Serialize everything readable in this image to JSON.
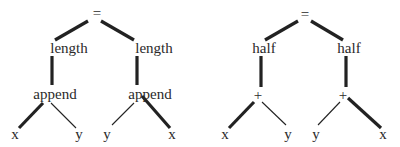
{
  "diagram": {
    "trees": [
      {
        "id": "left-tree",
        "nodes": [
          {
            "id": "eq",
            "label": "=",
            "x": 97,
            "y": 13
          },
          {
            "id": "len1",
            "label": "length",
            "x": 69,
            "y": 48
          },
          {
            "id": "len2",
            "label": "length",
            "x": 154,
            "y": 48
          },
          {
            "id": "app1",
            "label": "append",
            "x": 55,
            "y": 94
          },
          {
            "id": "app2",
            "label": "append",
            "x": 150,
            "y": 94
          },
          {
            "id": "x1",
            "label": "x",
            "x": 15,
            "y": 134
          },
          {
            "id": "y1",
            "label": "y",
            "x": 79,
            "y": 134
          },
          {
            "id": "y2",
            "label": "y",
            "x": 107,
            "y": 134
          },
          {
            "id": "x2",
            "label": "x",
            "x": 172,
            "y": 134
          }
        ],
        "edges": [
          {
            "from": [
              88,
              21
            ],
            "to": [
              55,
              40
            ],
            "weight": "thick"
          },
          {
            "from": [
              101,
              21
            ],
            "to": [
              134,
              40
            ],
            "weight": "thick"
          },
          {
            "from": [
              52,
              56
            ],
            "to": [
              52,
              85
            ],
            "weight": "thick"
          },
          {
            "from": [
              137,
              56
            ],
            "to": [
              137,
              85
            ],
            "weight": "thick"
          },
          {
            "from": [
              43,
              103
            ],
            "to": [
              19,
              128
            ],
            "weight": "thick"
          },
          {
            "from": [
              51,
              103
            ],
            "to": [
              76,
              128
            ],
            "weight": "thin"
          },
          {
            "from": [
              134,
              103
            ],
            "to": [
              112,
              125
            ],
            "weight": "thin"
          },
          {
            "from": [
              142,
              96
            ],
            "to": [
              170,
              128
            ],
            "weight": "thick"
          }
        ]
      },
      {
        "id": "right-tree",
        "nodes": [
          {
            "id": "eq",
            "label": "=",
            "x": 305,
            "y": 14
          },
          {
            "id": "half1",
            "label": "half",
            "x": 264,
            "y": 48
          },
          {
            "id": "half2",
            "label": "half",
            "x": 349,
            "y": 48
          },
          {
            "id": "plus1",
            "label": "+",
            "x": 258,
            "y": 95
          },
          {
            "id": "plus2",
            "label": "+",
            "x": 343,
            "y": 95
          },
          {
            "id": "x1",
            "label": "x",
            "x": 225,
            "y": 134
          },
          {
            "id": "y1",
            "label": "y",
            "x": 288,
            "y": 134
          },
          {
            "id": "y2",
            "label": "y",
            "x": 316,
            "y": 134
          },
          {
            "id": "x2",
            "label": "x",
            "x": 383,
            "y": 134
          }
        ],
        "edges": [
          {
            "from": [
              298,
              21
            ],
            "to": [
              265,
              40
            ],
            "weight": "thick"
          },
          {
            "from": [
              311,
              21
            ],
            "to": [
              343,
              40
            ],
            "weight": "thick"
          },
          {
            "from": [
              261,
              56
            ],
            "to": [
              261,
              87
            ],
            "weight": "thick"
          },
          {
            "from": [
              346,
              56
            ],
            "to": [
              346,
              87
            ],
            "weight": "thick"
          },
          {
            "from": [
              254,
              102
            ],
            "to": [
              229,
              128
            ],
            "weight": "thick"
          },
          {
            "from": [
              262,
              102
            ],
            "to": [
              286,
              125
            ],
            "weight": "thin"
          },
          {
            "from": [
              340,
              102
            ],
            "to": [
              318,
              125
            ],
            "weight": "thin"
          },
          {
            "from": [
              348,
              98
            ],
            "to": [
              381,
              128
            ],
            "weight": "thick"
          }
        ]
      }
    ],
    "style": {
      "edge_color": "#222222",
      "thick_width": 3.2,
      "thin_width": 1.1
    }
  }
}
